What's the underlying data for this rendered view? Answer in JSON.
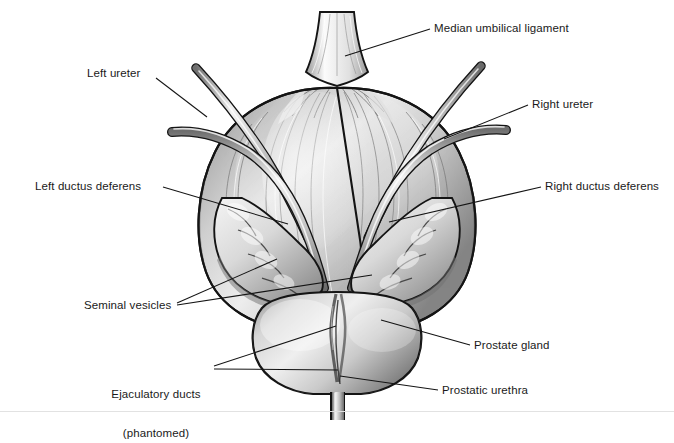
{
  "figure": {
    "background_color": "#ffffff",
    "line_color": "#1a1a1a",
    "label_font_size_px": 11.5
  },
  "labels": [
    {
      "id": "median-umbilical-ligament",
      "text": "Median umbilical ligament",
      "lines": [
        "Median umbilical ligament"
      ],
      "x": 434,
      "y": 22,
      "align": "left"
    },
    {
      "id": "left-ureter",
      "text": "Left ureter",
      "lines": [
        "Left ureter"
      ],
      "x": 87,
      "y": 67,
      "align": "left"
    },
    {
      "id": "right-ureter",
      "text": "Right ureter",
      "lines": [
        "Right ureter"
      ],
      "x": 532,
      "y": 98,
      "align": "left"
    },
    {
      "id": "left-ductus-deferens",
      "text": "Left ductus deferens",
      "lines": [
        "Left ductus deferens"
      ],
      "x": 35,
      "y": 180,
      "align": "left"
    },
    {
      "id": "right-ductus-deferens",
      "text": "Right ductus deferens",
      "lines": [
        "Right ductus deferens"
      ],
      "x": 545,
      "y": 180,
      "align": "left"
    },
    {
      "id": "seminal-vesicles",
      "text": "Seminal vesicles",
      "lines": [
        "Seminal vesicles"
      ],
      "x": 84,
      "y": 299,
      "align": "left"
    },
    {
      "id": "ejaculatory-ducts",
      "text": "Ejaculatory ducts (phantomed)",
      "lines": [
        "Ejaculatory ducts",
        "(phantomed)"
      ],
      "x": 96,
      "y": 362,
      "align": "center"
    },
    {
      "id": "prostate-gland",
      "text": "Prostate gland",
      "lines": [
        "Prostate gland"
      ],
      "x": 474,
      "y": 339,
      "align": "left"
    },
    {
      "id": "prostatic-urethra",
      "text": "Prostatic urethra",
      "lines": [
        "Prostatic urethra"
      ],
      "x": 442,
      "y": 384,
      "align": "left"
    }
  ],
  "anatomy": {
    "bladder": "urinary bladder dome with detrusor muscle striations",
    "median_umbilical_ligament": "urachus remnant at superior midline",
    "ureters": [
      "left ureter",
      "right ureter"
    ],
    "ductus_deferens": [
      "left ductus deferens",
      "right ductus deferens"
    ],
    "seminal_vesicles": [
      "left seminal vesicle",
      "right seminal vesicle"
    ],
    "prostate_gland": "bilobed prostate inferior to bladder",
    "prostatic_urethra": "urethra exiting prostate apex",
    "ejaculatory_ducts": "phantomed ducts within prostate"
  }
}
